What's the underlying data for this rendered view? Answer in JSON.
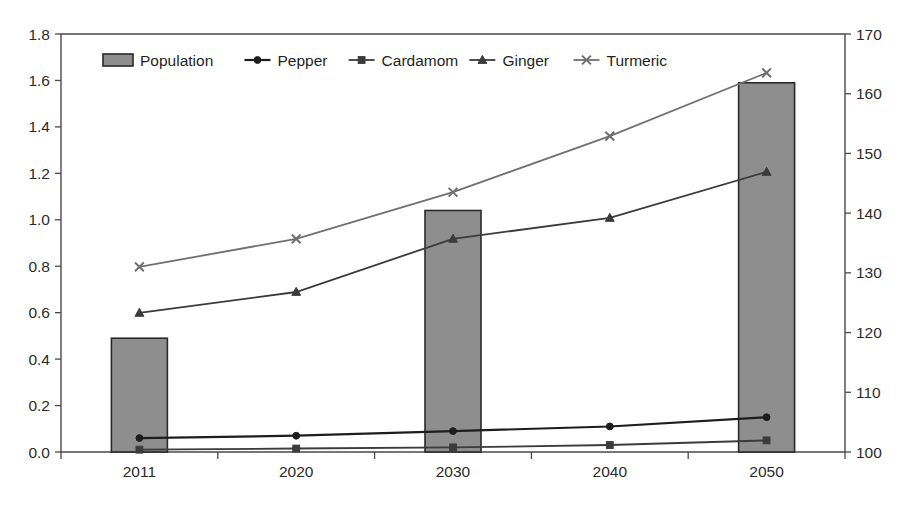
{
  "chart_data": {
    "type": "line",
    "title": "",
    "subtitle": "",
    "xlabel": "",
    "ylabel": "",
    "categories": [
      "2011",
      "2020",
      "2030",
      "2040",
      "2050"
    ],
    "grid": false,
    "legend_position": "top-inside",
    "axes": {
      "left": {
        "min": 0.0,
        "max": 1.8,
        "step": 0.2,
        "ticks": [
          "0.0",
          "0.2",
          "0.4",
          "0.6",
          "0.8",
          "1.0",
          "1.2",
          "1.4",
          "1.6",
          "1.8"
        ],
        "tick_values": [
          0.0,
          0.2,
          0.4,
          0.6,
          0.8,
          1.0,
          1.2,
          1.4,
          1.6,
          1.8
        ]
      },
      "right": {
        "min": 100,
        "max": 170,
        "step": 10,
        "ticks": [
          "100",
          "110",
          "120",
          "130",
          "140",
          "150",
          "160",
          "170"
        ],
        "tick_values": [
          100,
          110,
          120,
          130,
          140,
          150,
          160,
          170
        ]
      }
    },
    "series": [
      {
        "name": "Population",
        "render": "bar",
        "axis": "left",
        "marker": "filled-rect",
        "color": "#8e8e8e",
        "edge_color": "#2a2a2a",
        "categories": [
          "2011",
          "2020",
          "2030",
          "2040",
          "2050"
        ],
        "values": [
          0.49,
          null,
          1.04,
          null,
          1.59
        ]
      },
      {
        "name": "Pepper",
        "render": "line",
        "axis": "left",
        "marker": "circle",
        "color": "#1d1d1d",
        "categories": [
          "2011",
          "2020",
          "2030",
          "2040",
          "2050"
        ],
        "values": [
          0.06,
          0.07,
          0.09,
          0.11,
          0.15
        ]
      },
      {
        "name": "Cardamom",
        "render": "line",
        "axis": "left",
        "marker": "square",
        "color": "#3b3b3b",
        "categories": [
          "2011",
          "2020",
          "2030",
          "2040",
          "2050"
        ],
        "values": [
          0.01,
          0.015,
          0.02,
          0.03,
          0.05
        ]
      },
      {
        "name": "Ginger",
        "render": "line",
        "axis": "right",
        "marker": "triangle",
        "color": "#3b3b3b",
        "categories": [
          "2011",
          "2020",
          "2030",
          "2040",
          "2050"
        ],
        "values": [
          123.3,
          126.8,
          135.7,
          139.2,
          146.9
        ]
      },
      {
        "name": "Turmeric",
        "render": "line",
        "axis": "right",
        "marker": "cross",
        "color": "#6f6f6f",
        "categories": [
          "2011",
          "2020",
          "2030",
          "2040",
          "2050"
        ],
        "values": [
          131.0,
          135.7,
          143.5,
          152.9,
          163.5
        ]
      }
    ]
  },
  "legend": {
    "items": [
      {
        "label": "Population",
        "marker": "filled-rect",
        "style": "bar"
      },
      {
        "label": "Pepper",
        "marker": "circle",
        "style": "line"
      },
      {
        "label": "Cardamom",
        "marker": "square",
        "style": "line"
      },
      {
        "label": "Ginger",
        "marker": "triangle",
        "style": "line"
      },
      {
        "label": "Turmeric",
        "marker": "cross",
        "style": "line"
      }
    ]
  }
}
